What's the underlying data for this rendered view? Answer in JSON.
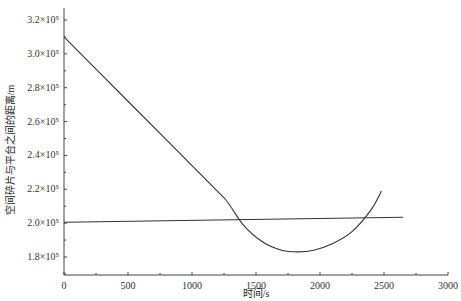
{
  "chart_data": {
    "type": "line",
    "title": "",
    "xlabel": "时间/s",
    "ylabel": "空间碎片与平台之间的距离/m",
    "xlim": [
      0,
      3000
    ],
    "ylim": [
      170000,
      330000
    ],
    "xticks": [
      0,
      500,
      1000,
      1500,
      2000,
      2500,
      3000
    ],
    "xtick_labels": [
      "0",
      "500",
      "1000",
      "1500",
      "2000",
      "2500",
      "3000"
    ],
    "yticks": [
      180000,
      200000,
      220000,
      240000,
      260000,
      280000,
      300000,
      320000
    ],
    "ytick_labels": [
      "1.8×10⁵",
      "2.0×10⁵",
      "2.2×10⁵",
      "2.4×10⁵",
      "2.6×10⁵",
      "2.8×10⁵",
      "3.0×10⁵",
      "3.2×10⁵"
    ],
    "grid": false,
    "legend": null,
    "series": [
      {
        "name": "distance",
        "x": [
          0,
          250,
          500,
          750,
          1000,
          1250,
          1400,
          1550,
          1700,
          1830,
          1950,
          2100,
          2250,
          2400,
          2480
        ],
        "y": [
          310000,
          291000,
          272000,
          253000,
          234000,
          215000,
          199000,
          189000,
          184000,
          183000,
          184000,
          188000,
          195000,
          208000,
          219000
        ]
      },
      {
        "name": "threshold",
        "x": [
          0,
          2650
        ],
        "y": [
          200500,
          203500
        ]
      }
    ]
  }
}
